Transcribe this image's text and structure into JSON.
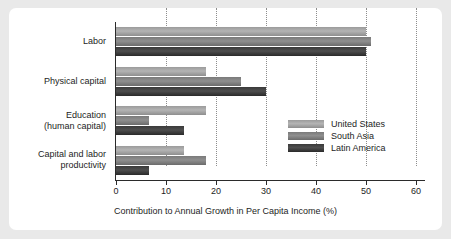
{
  "chart_data": {
    "type": "bar",
    "orientation": "horizontal",
    "title": "",
    "xlabel": "Contribution to Annual Growth in Per Capita Income (%)",
    "ylabel": "",
    "xlim": [
      0,
      60
    ],
    "xticks": [
      0,
      10,
      20,
      30,
      40,
      50,
      60
    ],
    "xtick_labels": [
      "0",
      "10",
      "20",
      "30",
      "40",
      "50",
      "60"
    ],
    "grid": "vertical-dotted",
    "legend_position": "center-right",
    "categories": [
      "Labor",
      "Physical capital",
      "Education\n(human capital)",
      "Capital and labor\nproductivity"
    ],
    "category_lines": [
      [
        "Labor"
      ],
      [
        "Physical capital"
      ],
      [
        "Education",
        "(human capital)"
      ],
      [
        "Capital and labor",
        "productivity"
      ]
    ],
    "series": [
      {
        "name": "United States",
        "color": "#a8a8a8",
        "values": [
          50,
          18,
          18,
          13.5
        ]
      },
      {
        "name": "South Asia",
        "color": "#848484",
        "values": [
          51,
          25,
          6.5,
          18
        ]
      },
      {
        "name": "Latin America",
        "color": "#3d3d3d",
        "values": [
          50,
          30,
          13.5,
          6.5
        ]
      }
    ]
  },
  "figure": {
    "background_color": "#e9e9e9",
    "panel_color": "#ffffff",
    "axis_color": "#2b2b2b",
    "grid_color": "#8d8d8d"
  }
}
